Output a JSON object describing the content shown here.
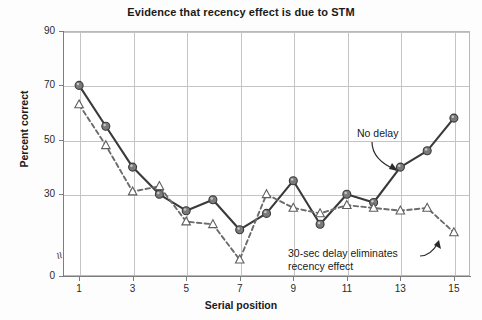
{
  "chart_data": {
    "type": "line",
    "title": "Evidence that recency effect is due to STM",
    "xlabel": "Serial position",
    "ylabel": "Percent correct",
    "x": [
      1,
      2,
      3,
      4,
      5,
      6,
      7,
      8,
      9,
      10,
      11,
      12,
      13,
      14,
      15
    ],
    "xticks": [
      1,
      3,
      5,
      7,
      9,
      11,
      13,
      15
    ],
    "xticklabels": [
      "1",
      "3",
      "5",
      "7",
      "9",
      "11",
      "13",
      "15"
    ],
    "yticks": [
      0,
      30,
      50,
      70,
      90
    ],
    "yticklabels": [
      "0",
      "30",
      "50",
      "70",
      "90"
    ],
    "ylim": [
      0,
      90
    ],
    "xlim": [
      0.4,
      15.6
    ],
    "grid": true,
    "axis_break": "y-axis broken between 0 and 30",
    "legend": "none (inline annotations)",
    "series": [
      {
        "name": "No delay",
        "marker": "filled-circle",
        "linestyle": "solid",
        "color": "#3a3a3a",
        "marker_color": "#7a7a7a",
        "values": [
          70,
          55,
          40,
          30,
          24,
          28,
          17,
          23,
          35,
          19,
          30,
          27,
          40,
          46,
          58
        ]
      },
      {
        "name": "30-sec delay",
        "marker": "open-triangle",
        "linestyle": "dashed",
        "color": "#6b6b6b",
        "marker_color": "#ffffff",
        "values": [
          63,
          48,
          31,
          33,
          20,
          19,
          6,
          30,
          25,
          23,
          26,
          25,
          24,
          25,
          16
        ]
      }
    ],
    "annotations": [
      {
        "id": "no-delay",
        "text": "No delay",
        "points_to": "solid line near serial position 14",
        "arrow": "curved down-right"
      },
      {
        "id": "delay",
        "text": "30-sec delay eliminates\nrecency effect",
        "points_to": "dashed line near serial position 14",
        "arrow": "curved up-right"
      }
    ]
  },
  "colors": {
    "grid": "#c4c4c4",
    "axis": "#7d7d7d",
    "text": "#1a1a1a",
    "solid_series": "#3a3a3a",
    "dashed_series": "#6b6b6b",
    "circle_fill": "#7a7a7a",
    "triangle_fill": "#ffffff",
    "plot_background": "#ffffff"
  },
  "symbols": {
    "axis_break": "≈"
  }
}
